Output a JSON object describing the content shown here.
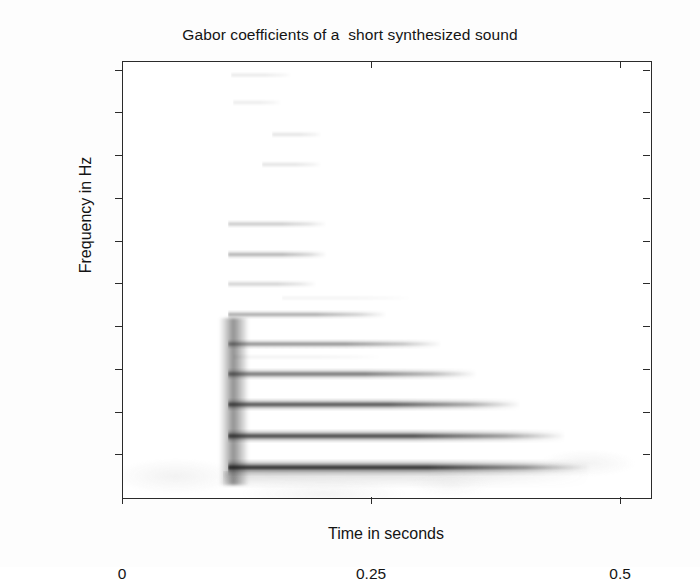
{
  "figure": {
    "title": "Gabor coefficients of a  short synthesized sound",
    "background": "#ffffff",
    "axis_color": "#2b2b2b"
  },
  "chart_data": {
    "type": "heatmap",
    "title": "Gabor coefficients of a  short synthesized sound",
    "xlabel": "Time in seconds",
    "ylabel": "Frequency in Hz",
    "xlim": [
      0,
      0.53
    ],
    "ylim": [
      0,
      10200
    ],
    "xticks": [
      0,
      0.25,
      0.5
    ],
    "xticklabels": [
      "0",
      "0.25",
      "0.5"
    ],
    "yticks": [
      1000,
      2000,
      3000,
      4000,
      5000,
      6000,
      7000,
      8000,
      9000,
      10000
    ],
    "yticklabels": [
      "1000",
      "2000",
      "3000",
      "4000",
      "5000",
      "6000",
      "7000",
      "8000",
      "9000",
      "10000"
    ],
    "grid": false,
    "legend": null,
    "colormap": "grayscale-inverted",
    "onset_time": 0.105,
    "onset_burst": {
      "t_start": 0.1,
      "t_end": 0.122,
      "f_low": 300,
      "f_high": 4200,
      "intensity": 0.55
    },
    "fundamental_hz": 720,
    "partials": [
      {
        "harmonic": 1,
        "freq_hz": 720,
        "t_start": 0.105,
        "t_end": 0.47,
        "intensity": 1.0,
        "bandwidth_hz": 170
      },
      {
        "harmonic": 2,
        "freq_hz": 1450,
        "t_start": 0.105,
        "t_end": 0.445,
        "intensity": 0.92,
        "bandwidth_hz": 150
      },
      {
        "harmonic": 3,
        "freq_hz": 2180,
        "t_start": 0.105,
        "t_end": 0.4,
        "intensity": 0.84,
        "bandwidth_hz": 130
      },
      {
        "harmonic": 4,
        "freq_hz": 2900,
        "t_start": 0.105,
        "t_end": 0.355,
        "intensity": 0.7,
        "bandwidth_hz": 115
      },
      {
        "harmonic": 5,
        "freq_hz": 3600,
        "t_start": 0.105,
        "t_end": 0.32,
        "intensity": 0.58,
        "bandwidth_hz": 105
      },
      {
        "harmonic": 6,
        "freq_hz": 4300,
        "t_start": 0.105,
        "t_end": 0.265,
        "intensity": 0.44,
        "bandwidth_hz": 95
      },
      {
        "harmonic": 7,
        "freq_hz": 5000,
        "t_start": 0.105,
        "t_end": 0.195,
        "intensity": 0.26,
        "bandwidth_hz": 80
      },
      {
        "harmonic": 8,
        "freq_hz": 5700,
        "t_start": 0.105,
        "t_end": 0.205,
        "intensity": 0.4,
        "bandwidth_hz": 85
      },
      {
        "harmonic": 9,
        "freq_hz": 6400,
        "t_start": 0.105,
        "t_end": 0.205,
        "intensity": 0.3,
        "bandwidth_hz": 80
      },
      {
        "harmonic": 11,
        "freq_hz": 7800,
        "t_start": 0.14,
        "t_end": 0.2,
        "intensity": 0.16,
        "bandwidth_hz": 60
      },
      {
        "harmonic": 12,
        "freq_hz": 8500,
        "t_start": 0.15,
        "t_end": 0.2,
        "intensity": 0.15,
        "bandwidth_hz": 55
      },
      {
        "harmonic": 13,
        "freq_hz": 9250,
        "t_start": 0.11,
        "t_end": 0.16,
        "intensity": 0.1,
        "bandwidth_hz": 50
      },
      {
        "harmonic": 14,
        "freq_hz": 9900,
        "t_start": 0.108,
        "t_end": 0.17,
        "intensity": 0.14,
        "bandwidth_hz": 55
      },
      {
        "harmonic": 0,
        "freq_hz": 3300,
        "t_start": 0.11,
        "t_end": 0.26,
        "intensity": 0.08,
        "bandwidth_hz": 70
      },
      {
        "harmonic": 0,
        "freq_hz": 4680,
        "t_start": 0.16,
        "t_end": 0.29,
        "intensity": 0.07,
        "bandwidth_hz": 55
      }
    ]
  }
}
